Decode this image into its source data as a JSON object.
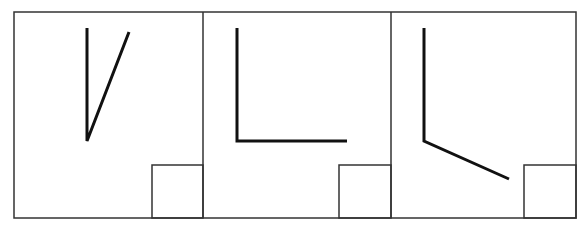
{
  "diagram": {
    "description": "Three panels each showing an angle formed by two line segments, with a small square in the bottom-right corner of each panel",
    "frame": {
      "x": 14,
      "y": 12,
      "width": 562,
      "height": 206,
      "stroke": "#333333",
      "stroke_width": 1.5
    },
    "dividers_x": [
      203,
      391
    ],
    "line_color": "#111111",
    "panels": [
      {
        "id": "panel-1",
        "angle_type": "acute",
        "vertex": [
          87,
          141
        ],
        "ray_a": [
          87,
          28
        ],
        "ray_b": [
          129,
          32
        ],
        "corner_box": {
          "x": 152,
          "y": 165,
          "width": 51,
          "height": 53
        }
      },
      {
        "id": "panel-2",
        "angle_type": "right",
        "vertex": [
          237,
          141
        ],
        "ray_a": [
          237,
          28
        ],
        "ray_b": [
          347,
          141
        ],
        "corner_box": {
          "x": 339,
          "y": 165,
          "width": 52,
          "height": 53
        }
      },
      {
        "id": "panel-3",
        "angle_type": "obtuse",
        "vertex": [
          424,
          141
        ],
        "ray_a": [
          424,
          28
        ],
        "ray_b": [
          509,
          179
        ],
        "corner_box": {
          "x": 524,
          "y": 165,
          "width": 52,
          "height": 53
        }
      }
    ]
  }
}
